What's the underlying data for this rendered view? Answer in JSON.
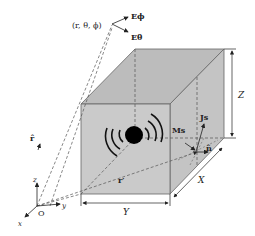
{
  "diagram": {
    "type": "radiating source in rectangular box with far-field coordinates",
    "labels": {
      "observation_point": "(r, θ, ϕ)",
      "e_phi": "Eϕ",
      "e_theta": "Eθ",
      "r_hat": "r̂",
      "r_prime": "r′",
      "js": "Js",
      "ms": "Ms",
      "n_hat": "n̂",
      "dim_x": "X",
      "dim_y": "Y",
      "dim_z": "Z",
      "axis_x": "x",
      "axis_y": "y",
      "axis_z": "z",
      "origin": "O"
    },
    "colors": {
      "box_front": "#c8c8c8",
      "box_top": "#bdbdbd",
      "box_side": "#c2c2c2",
      "source": "#000000",
      "lines": "#444444"
    }
  }
}
